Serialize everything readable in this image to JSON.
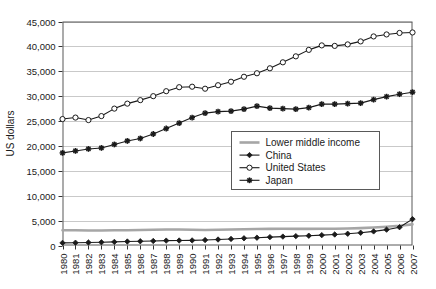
{
  "chart_data": {
    "type": "line",
    "title": "",
    "xlabel": "",
    "ylabel": "US dollars",
    "ylim": [
      0,
      45000
    ],
    "ytick_step": 5000,
    "grid": true,
    "legend_position": "center-right",
    "x": [
      1980,
      1981,
      1982,
      1983,
      1984,
      1985,
      1986,
      1987,
      1988,
      1989,
      1990,
      1991,
      1992,
      1993,
      1994,
      1995,
      1996,
      1997,
      1998,
      1999,
      2000,
      2001,
      2002,
      2003,
      2004,
      2005,
      2006,
      2007
    ],
    "ytick_labels": [
      "0",
      "5,000",
      "10,000",
      "15,000",
      "20,000",
      "25,000",
      "30,000",
      "35,000",
      "40,000",
      "45,000"
    ],
    "xtick_labels": [
      "1980",
      "1981",
      "1982",
      "1983",
      "1984",
      "1985",
      "1986",
      "1987",
      "1988",
      "1989",
      "1990",
      "1991",
      "1992",
      "1993",
      "1994",
      "1995",
      "1996",
      "1997",
      "1998",
      "1999",
      "2000",
      "2001",
      "2002",
      "2003",
      "2004",
      "2005",
      "2006",
      "2007"
    ],
    "series": [
      {
        "name": "Lower middle income",
        "marker": "none",
        "color": "#a6a6a6",
        "values": [
          3050,
          3050,
          3020,
          3020,
          3050,
          3070,
          3120,
          3170,
          3220,
          3200,
          3150,
          3120,
          3150,
          3200,
          3250,
          3300,
          3330,
          3350,
          3330,
          3330,
          3350,
          3380,
          3420,
          3500,
          3620,
          3780,
          3980,
          4250
        ]
      },
      {
        "name": "China",
        "marker": "filled-diamond",
        "color": "#1a1a1a",
        "values": [
          520,
          560,
          600,
          650,
          720,
          800,
          850,
          910,
          980,
          1000,
          1020,
          1090,
          1200,
          1320,
          1450,
          1570,
          1680,
          1790,
          1880,
          1970,
          2080,
          2210,
          2360,
          2560,
          2830,
          3180,
          3680,
          5300
        ]
      },
      {
        "name": "United States",
        "marker": "open-circle",
        "color": "#1a1a1a",
        "values": [
          25400,
          25700,
          25200,
          26000,
          27500,
          28500,
          29200,
          30000,
          31000,
          31800,
          31900,
          31500,
          32200,
          32900,
          33900,
          34600,
          35600,
          36800,
          38000,
          39300,
          40200,
          40100,
          40400,
          41000,
          42000,
          42400,
          42700,
          42800
        ]
      },
      {
        "name": "Japan",
        "marker": "star",
        "color": "#1a1a1a",
        "values": [
          18600,
          19000,
          19400,
          19600,
          20300,
          21000,
          21500,
          22400,
          23500,
          24600,
          25700,
          26600,
          26900,
          27000,
          27400,
          28000,
          27600,
          27500,
          27400,
          27700,
          28400,
          28400,
          28500,
          28600,
          29300,
          29900,
          30400,
          30800
        ]
      }
    ]
  },
  "legend": {
    "items": [
      {
        "label": "Lower middle income"
      },
      {
        "label": "China"
      },
      {
        "label": "United States"
      },
      {
        "label": "Japan"
      }
    ]
  }
}
